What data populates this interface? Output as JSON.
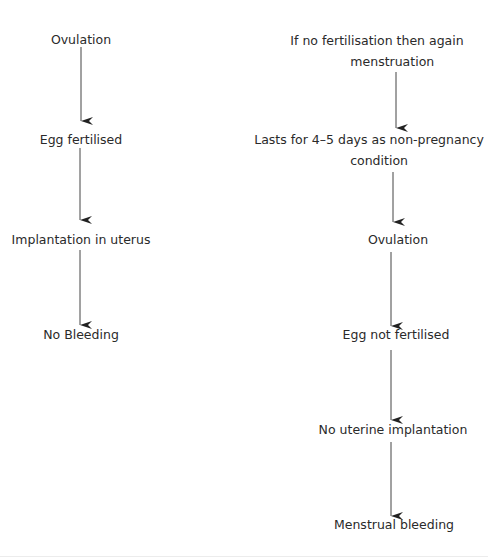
{
  "diagram": {
    "type": "flowchart",
    "left_flow": {
      "nodes": [
        {
          "label": "Ovulation"
        },
        {
          "label": "Egg fertilised"
        },
        {
          "label": "Implantation in uterus"
        },
        {
          "label": "No Bleeding"
        }
      ]
    },
    "right_flow": {
      "nodes": [
        {
          "line1": "If no fertilisation then again",
          "line2": "menstruation"
        },
        {
          "line1": "Lasts for 4–5 days as non-pregnancy",
          "line2": "condition"
        },
        {
          "label": "Ovulation"
        },
        {
          "label": "Egg not fertilised"
        },
        {
          "label": "No uterine implantation"
        },
        {
          "label": "Menstrual bleeding"
        }
      ]
    },
    "colors": {
      "text": "#2a2a2a",
      "arrow": "#333333",
      "background": "#ffffff"
    }
  }
}
